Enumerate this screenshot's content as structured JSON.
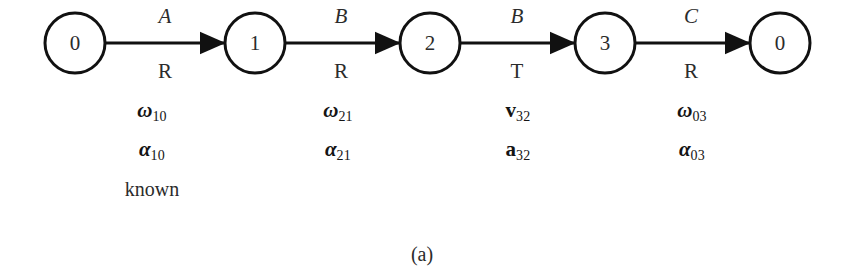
{
  "figure": {
    "caption": "(a)",
    "background_color": "#ffffff",
    "stroke_color": "#111111",
    "text_color": "#2b2b2b"
  },
  "nodes": [
    {
      "id": "n0a",
      "label": "0",
      "cx": 75,
      "cy": 43,
      "r": 30
    },
    {
      "id": "n1",
      "label": "1",
      "cx": 255,
      "cy": 43,
      "r": 30
    },
    {
      "id": "n2",
      "label": "2",
      "cx": 430,
      "cy": 43,
      "r": 30
    },
    {
      "id": "n3",
      "label": "3",
      "cx": 605,
      "cy": 43,
      "r": 30
    },
    {
      "id": "n0b",
      "label": "0",
      "cx": 780,
      "cy": 43,
      "r": 30
    }
  ],
  "edges": [
    {
      "id": "e0",
      "from": "n0a",
      "to": "n1",
      "top_label": "A",
      "bottom_label": "R",
      "label_x": 165,
      "x1": 105,
      "x2": 225,
      "y": 43
    },
    {
      "id": "e1",
      "from": "n1",
      "to": "n2",
      "top_label": "B",
      "bottom_label": "R",
      "label_x": 341,
      "x1": 285,
      "x2": 400,
      "y": 43
    },
    {
      "id": "e2",
      "from": "n2",
      "to": "n3",
      "top_label": "B",
      "bottom_label": "T",
      "label_x": 517,
      "x1": 460,
      "x2": 575,
      "y": 43
    },
    {
      "id": "e3",
      "from": "n3",
      "to": "n0b",
      "top_label": "C",
      "bottom_label": "R",
      "label_x": 691,
      "x1": 635,
      "x2": 750,
      "y": 43
    }
  ],
  "variable_columns": [
    {
      "id": "vars-10",
      "x": 152,
      "lines": [
        {
          "symbol": "ω",
          "script": "greek",
          "subscript": "10"
        },
        {
          "symbol": "α",
          "script": "greek",
          "subscript": "10"
        }
      ],
      "note": "known"
    },
    {
      "id": "vars-21",
      "x": 338,
      "lines": [
        {
          "symbol": "ω",
          "script": "greek",
          "subscript": "21"
        },
        {
          "symbol": "α",
          "script": "greek",
          "subscript": "21"
        }
      ],
      "note": ""
    },
    {
      "id": "vars-32",
      "x": 518,
      "lines": [
        {
          "symbol": "v",
          "script": "latin",
          "subscript": "32"
        },
        {
          "symbol": "a",
          "script": "latin",
          "subscript": "32"
        }
      ],
      "note": ""
    },
    {
      "id": "vars-03",
      "x": 692,
      "lines": [
        {
          "symbol": "ω",
          "script": "greek",
          "subscript": "03"
        },
        {
          "symbol": "α",
          "script": "greek",
          "subscript": "03"
        }
      ],
      "note": ""
    }
  ],
  "layout": {
    "var_row1_y": 110,
    "var_row2_y": 143,
    "note_y": 178,
    "caption_x": 422,
    "caption_y": 243
  }
}
